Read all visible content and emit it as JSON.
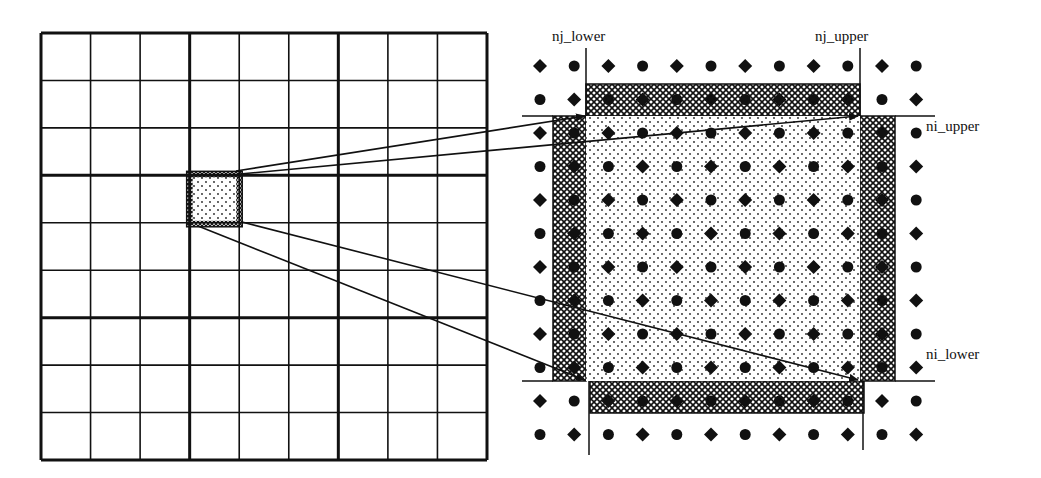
{
  "colors": {
    "ink": "#111111",
    "background": "#ffffff",
    "inner_fill": "#ffffff"
  },
  "left_grid": {
    "x0": 41,
    "y0": 33,
    "x1": 487,
    "y1": 460,
    "cells": 9,
    "block_every": 3,
    "highlight_cell": {
      "col": 3,
      "row": 3
    }
  },
  "right_panel": {
    "labels": {
      "nj_lower": "nj_lower",
      "nj_upper": "nj_upper",
      "ni_upper": "ni_upper",
      "ni_lower": "ni_lower"
    },
    "marker_grid": {
      "x0": 540,
      "y0": 66,
      "dx": 34.2,
      "dy": 33.5,
      "cols": 12,
      "rows": 12,
      "pattern": "checkerboard: (row+col) even = diamond, odd = circle"
    },
    "inner_region": {
      "x0": 586,
      "y0": 116,
      "x1": 860,
      "y1": 381,
      "pattern": "stipple"
    },
    "halo_strips": {
      "top": {
        "x0": 586,
        "y0": 84,
        "x1": 860,
        "y1": 116
      },
      "bottom": {
        "x0": 590,
        "y0": 381,
        "x1": 864,
        "y1": 413
      },
      "left": {
        "x0": 553,
        "y0": 116,
        "x1": 586,
        "y1": 381
      },
      "right": {
        "x0": 860,
        "y0": 116,
        "x1": 895,
        "y1": 381
      },
      "pattern": "crosshatch"
    },
    "boundary_lines": {
      "nj_lower_x": 586,
      "nj_upper_x": 860,
      "ni_upper_y": 116,
      "ni_lower_y": 381
    }
  },
  "arrows": [
    {
      "from": [
        236,
        171
      ],
      "to": [
        585,
        116
      ]
    },
    {
      "from": [
        240,
        174
      ],
      "to": [
        858,
        116
      ]
    },
    {
      "from": [
        242,
        222
      ],
      "to": [
        858,
        380
      ]
    },
    {
      "from": [
        198,
        226
      ],
      "to": [
        585,
        380
      ]
    }
  ]
}
